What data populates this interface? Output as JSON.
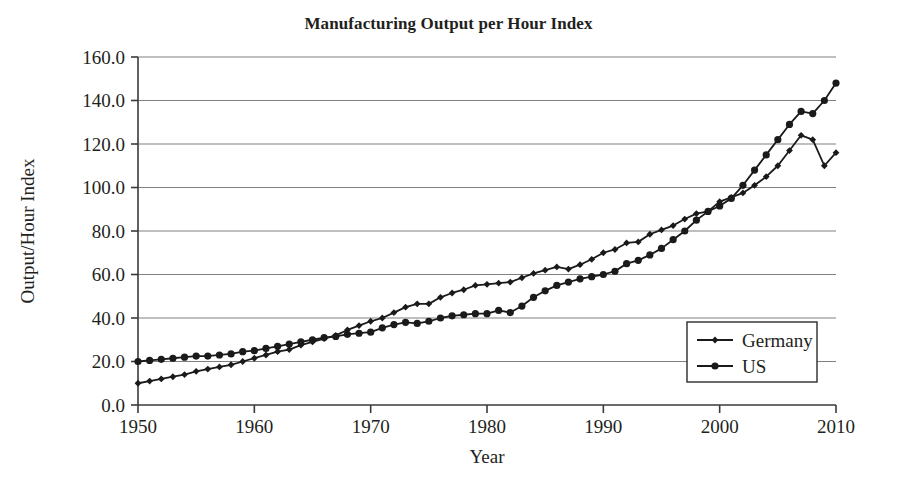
{
  "chart_data": {
    "type": "line",
    "title": "Manufacturing Output per Hour Index",
    "xlabel": "Year",
    "ylabel": "Output/Hour Index",
    "xlim": [
      1950,
      2010
    ],
    "ylim": [
      0,
      160
    ],
    "ytick_labels": [
      "0.0",
      "20.0",
      "40.0",
      "60.0",
      "80.0",
      "100.0",
      "120.0",
      "140.0",
      "160.0"
    ],
    "yticks": [
      0,
      20,
      40,
      60,
      80,
      100,
      120,
      140,
      160
    ],
    "xtick_labels": [
      "1950",
      "1960",
      "1970",
      "1980",
      "1990",
      "2000",
      "2010"
    ],
    "xticks": [
      1950,
      1960,
      1970,
      1980,
      1990,
      2000,
      2010
    ],
    "grid": "horizontal",
    "legend_position": "bottom-right",
    "line_color": "#1a1a1a",
    "grid_color": "#808080",
    "axis_color": "#3a3a3a",
    "x": [
      1950,
      1951,
      1952,
      1953,
      1954,
      1955,
      1956,
      1957,
      1958,
      1959,
      1960,
      1961,
      1962,
      1963,
      1964,
      1965,
      1966,
      1967,
      1968,
      1969,
      1970,
      1971,
      1972,
      1973,
      1974,
      1975,
      1976,
      1977,
      1978,
      1979,
      1980,
      1981,
      1982,
      1983,
      1984,
      1985,
      1986,
      1987,
      1988,
      1989,
      1990,
      1991,
      1992,
      1993,
      1994,
      1995,
      1996,
      1997,
      1998,
      1999,
      2000,
      2001,
      2002,
      2003,
      2004,
      2005,
      2006,
      2007,
      2008,
      2009,
      2010
    ],
    "series": [
      {
        "name": "Germany",
        "marker": "diamond",
        "values": [
          10.0,
          11.0,
          12.0,
          13.0,
          14.0,
          15.5,
          16.5,
          17.5,
          18.5,
          20.0,
          21.5,
          23.0,
          24.5,
          25.5,
          27.5,
          29.0,
          30.5,
          32.0,
          34.5,
          36.5,
          38.5,
          40.0,
          42.5,
          45.0,
          46.5,
          46.5,
          49.5,
          51.5,
          53.0,
          55.0,
          55.5,
          56.0,
          56.5,
          58.5,
          60.5,
          62.0,
          63.5,
          62.5,
          64.5,
          67.0,
          70.0,
          71.5,
          74.5,
          75.0,
          78.5,
          80.5,
          82.5,
          85.5,
          88.0,
          89.0,
          93.5,
          95.5,
          97.5,
          101.0,
          105.0,
          110.0,
          117.0,
          124.0,
          122.0,
          110.0,
          116.0
        ]
      },
      {
        "name": "US",
        "marker": "circle",
        "values": [
          20.0,
          20.5,
          21.0,
          21.5,
          22.0,
          22.5,
          22.5,
          23.0,
          23.5,
          24.5,
          25.0,
          26.0,
          27.0,
          28.0,
          29.0,
          30.0,
          31.0,
          31.5,
          32.5,
          33.0,
          33.5,
          35.5,
          37.0,
          38.0,
          37.5,
          38.5,
          40.0,
          41.0,
          41.5,
          42.0,
          42.0,
          43.5,
          42.5,
          45.5,
          49.5,
          52.5,
          55.0,
          56.5,
          58.0,
          59.0,
          60.0,
          61.5,
          65.0,
          66.5,
          69.0,
          72.0,
          76.0,
          80.0,
          85.0,
          89.0,
          91.5,
          95.0,
          101.0,
          108.0,
          115.0,
          122.0,
          129.0,
          135.0,
          134.0,
          140.0,
          148.0
        ]
      }
    ]
  },
  "legend": {
    "entries": [
      {
        "label": "Germany"
      },
      {
        "label": "US"
      }
    ]
  }
}
